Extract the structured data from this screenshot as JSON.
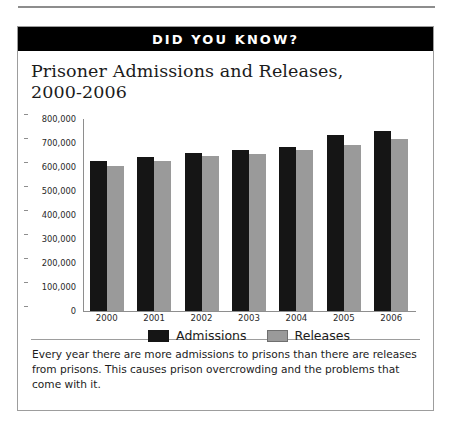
{
  "banner": {
    "label": "DID YOU KNOW?"
  },
  "title": {
    "line1": "Prisoner Admissions and Releases,",
    "line2": "2000-2006"
  },
  "caption": {
    "text": "Every year there are more admissions to prisons than there are releases from prisons. This causes prison overcrowding and the problems that come with it."
  },
  "colors": {
    "admissions": "#151515",
    "releases": "#9a9a9a",
    "banner_background": "#000000",
    "banner_text": "#ffffff",
    "border": "#9d9d9d"
  },
  "chart_data": {
    "type": "bar",
    "title": "Prisoner Admissions and Releases, 2000-2006",
    "xlabel": "",
    "ylabel": "",
    "categories": [
      "2000",
      "2001",
      "2002",
      "2003",
      "2004",
      "2005",
      "2006"
    ],
    "series": [
      {
        "name": "Admissions",
        "values": [
          625000,
          640000,
          660000,
          670000,
          685000,
          735000,
          750000
        ]
      },
      {
        "name": "Releases",
        "values": [
          605000,
          625000,
          645000,
          655000,
          670000,
          690000,
          715000
        ]
      }
    ],
    "ylim": [
      0,
      800000
    ],
    "ytick_values": [
      800000,
      700000,
      600000,
      500000,
      400000,
      300000,
      200000,
      100000,
      0
    ],
    "ytick_labels": [
      "800,000",
      "700,000",
      "600,000",
      "500,000",
      "400,000",
      "300,000",
      "200,000",
      "100,000",
      "0"
    ],
    "grid": false,
    "legend_position": "bottom"
  }
}
